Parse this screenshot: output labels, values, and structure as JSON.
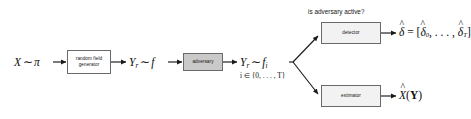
{
  "figure": {
    "type": "block-diagram",
    "title": "",
    "background_color": "#ffffff",
    "accent_box_color": "#c9c9c9",
    "line_color": "#1a1a1a"
  },
  "labels": {
    "source": "X ~ pi",
    "source_var": "X",
    "source_rel": "∼",
    "source_dist": "π",
    "field_out_var": "Y",
    "field_out_sub": "r",
    "field_out_rel": "∼",
    "field_out_dist": "f",
    "adv_out_var": "Y",
    "adv_out_sub": "r",
    "adv_out_rel": "∼",
    "adv_out_dist": "f",
    "adv_out_dist_sub": "i",
    "index_note": "i ∈ {0, . . . , T}",
    "detector_question": "is adversary active?",
    "detector_output": "δ̂ = [δ̂₀, . . . , δ̂_T]",
    "detector_out_lhs": "δ",
    "detector_out_eq": " = [",
    "detector_out_first": "δ",
    "detector_out_first_sub": "0",
    "detector_out_mid": ", . . . , ",
    "detector_out_last": "δ",
    "detector_out_last_sub": "T",
    "detector_out_close": "]",
    "estimator_output": "X̂(Y)",
    "estimator_out_lhs": "X",
    "estimator_out_open": "(",
    "estimator_out_arg": "Y",
    "estimator_out_close": ")"
  },
  "blocks": [
    {
      "id": "random-field-generator",
      "line1": "random field",
      "line2": "generator",
      "fill": "#ffffff"
    },
    {
      "id": "adversary",
      "line1": "adversary",
      "line2": "",
      "fill": "#c9c9c9"
    },
    {
      "id": "detector",
      "line1": "detector",
      "line2": "",
      "fill": "#f2f2f2"
    },
    {
      "id": "estimator",
      "line1": "estimator",
      "line2": "",
      "fill": "#f2f2f2"
    }
  ],
  "flow": {
    "description": "X ~ pi -> random field generator -> Y_r ~ f -> adversary -> Y_r ~ f_i, i in {0,...,T} -> branches to detector and estimator",
    "branch_point": "after adversary output",
    "branches": [
      "detector",
      "estimator"
    ]
  }
}
